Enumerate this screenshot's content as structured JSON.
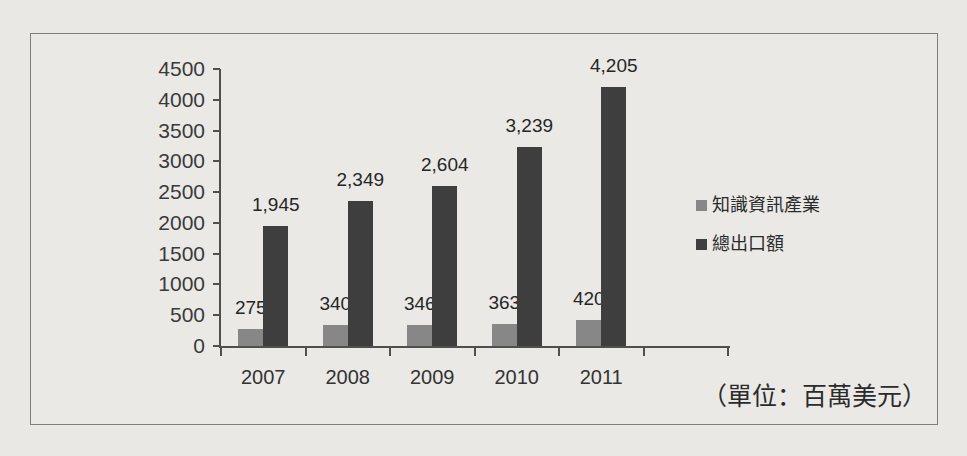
{
  "chart_data": {
    "type": "bar",
    "title": "",
    "xlabel": "",
    "ylabel": "",
    "categories": [
      "2007",
      "2008",
      "2009",
      "2010",
      "2011"
    ],
    "series": [
      {
        "name": "知識資訊產業",
        "color": "#878787",
        "values": [
          275,
          340,
          346,
          363,
          420
        ],
        "labels": [
          "275",
          "340",
          "346",
          "363",
          "420"
        ]
      },
      {
        "name": "總出口額",
        "color": "#3e3e3e",
        "values": [
          1945,
          2349,
          2604,
          3239,
          4205
        ],
        "labels": [
          "1,945",
          "2,349",
          "2,604",
          "3,239",
          "4,205"
        ]
      }
    ],
    "ylim": [
      0,
      4500
    ],
    "ytick_step": 500,
    "ytick_labels": [
      "0",
      "500",
      "1000",
      "1500",
      "2000",
      "2500",
      "3000",
      "3500",
      "4000",
      "4500"
    ],
    "grid": "off",
    "legend_position": "right",
    "unit_note": "（單位：百萬美元）"
  },
  "colors": {
    "background": "#e9e8e4",
    "frame_border": "#7e7e7e",
    "axis": "#4f4f4f",
    "series1": "#878787",
    "series2": "#3e3e3e",
    "text": "#2b2b2b"
  }
}
